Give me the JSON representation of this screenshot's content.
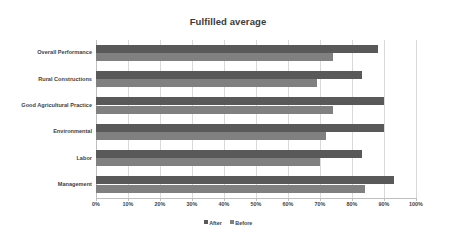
{
  "chart_data": {
    "type": "bar",
    "orientation": "horizontal",
    "title": "Fulfilled average",
    "xlabel": "",
    "ylabel": "",
    "xlim": [
      0,
      100
    ],
    "xtick_labels": [
      "0%",
      "10%",
      "20%",
      "30%",
      "40%",
      "50%",
      "60%",
      "70%",
      "80%",
      "90%",
      "100%"
    ],
    "xtick_values": [
      0,
      10,
      20,
      30,
      40,
      50,
      60,
      70,
      80,
      90,
      100
    ],
    "grid": "vertical",
    "legend_position": "bottom",
    "categories": [
      "Overall Performance",
      "Rural Constructions",
      "Good Agricultural Practice",
      "Environmental",
      "Labor",
      "Management"
    ],
    "series": [
      {
        "name": "After",
        "color": "#595959",
        "values": [
          88,
          83,
          90,
          90,
          83,
          93
        ]
      },
      {
        "name": "Before",
        "color": "#808080",
        "values": [
          74,
          69,
          74,
          72,
          70,
          84
        ]
      }
    ]
  },
  "legend": {
    "items": [
      {
        "label": "After",
        "color": "#595959"
      },
      {
        "label": "Before",
        "color": "#808080"
      }
    ]
  },
  "colors": {
    "after": "#595959",
    "before": "#808080",
    "gridline": "#d9d9d9",
    "axis": "#bfbfbf",
    "text": "#3f3f3f",
    "background": "#ffffff"
  }
}
